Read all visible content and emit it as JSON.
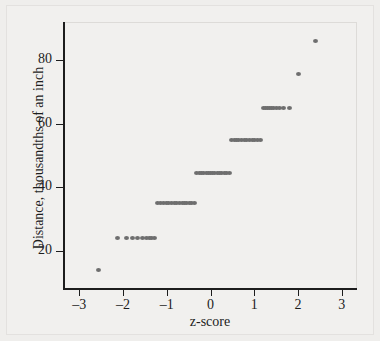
{
  "figure": {
    "background_color": "#efeeec",
    "point_color": "#6e6e6e",
    "axis_color": "#1d1d1d"
  },
  "axes": {
    "xlabel": "z-score",
    "ylabel": "Distance, thousandths of an inch",
    "xticks": [
      "–3",
      "–2",
      "–1",
      "0",
      "1",
      "2",
      "3"
    ],
    "xtick_values": [
      -3,
      -2,
      -1,
      0,
      1,
      2,
      3
    ],
    "yticks": [
      "20",
      "40",
      "60",
      "80"
    ],
    "ytick_values": [
      20,
      40,
      60,
      80
    ]
  },
  "chart_data": {
    "type": "scatter",
    "title": "",
    "xlabel": "z-score",
    "ylabel": "Distance, thousandths of an inch",
    "xlim": [
      -3.35,
      3.35
    ],
    "ylim": [
      8,
      92
    ],
    "grid": false,
    "legend": null,
    "x": [
      -2.55,
      -2.12,
      -1.92,
      -1.79,
      -1.66,
      -1.56,
      -1.47,
      -1.4,
      -1.34,
      -1.29,
      -1.22,
      -1.15,
      -1.08,
      -1.01,
      -0.95,
      -0.89,
      -0.83,
      -0.77,
      -0.71,
      -0.65,
      -0.6,
      -0.54,
      -0.48,
      -0.43,
      -0.37,
      -0.32,
      -0.26,
      -0.21,
      -0.15,
      -0.1,
      -0.05,
      0.0,
      0.05,
      0.1,
      0.15,
      0.21,
      0.26,
      0.32,
      0.37,
      0.43,
      0.48,
      0.54,
      0.6,
      0.65,
      0.71,
      0.77,
      0.83,
      0.89,
      0.95,
      1.01,
      1.08,
      1.15,
      1.22,
      1.26,
      1.3,
      1.34,
      1.39,
      1.44,
      1.5,
      1.58,
      1.67,
      1.8,
      2.02,
      2.41
    ],
    "y": [
      14,
      24,
      24,
      24,
      24,
      24,
      24,
      24,
      24,
      24,
      35,
      35,
      35,
      35,
      35,
      35,
      35,
      35,
      35,
      35,
      35,
      35,
      35,
      35,
      35,
      44.5,
      44.5,
      44.5,
      44.5,
      44.5,
      44.5,
      44.5,
      44.5,
      44.5,
      44.5,
      44.5,
      44.5,
      44.5,
      44.5,
      44.5,
      55,
      55,
      55,
      55,
      55,
      55,
      55,
      55,
      55,
      55,
      55,
      55,
      65,
      65,
      65,
      65,
      65,
      65,
      65,
      65,
      65,
      65,
      75.5,
      86
    ],
    "levels": [
      {
        "value": 14,
        "count": 1,
        "z_range": [
          -2.55,
          -2.55
        ]
      },
      {
        "value": 24,
        "count": 9,
        "z_range": [
          -2.12,
          -1.29
        ]
      },
      {
        "value": 35,
        "count": 15,
        "z_range": [
          -1.22,
          -0.37
        ]
      },
      {
        "value": 44.5,
        "count": 15,
        "z_range": [
          -0.32,
          0.43
        ]
      },
      {
        "value": 55,
        "count": 12,
        "z_range": [
          0.48,
          1.15
        ]
      },
      {
        "value": 65,
        "count": 10,
        "z_range": [
          1.22,
          1.8
        ]
      },
      {
        "value": 75.5,
        "count": 1,
        "z_range": [
          2.02,
          2.02
        ]
      },
      {
        "value": 86,
        "count": 1,
        "z_range": [
          2.41,
          2.41
        ]
      }
    ]
  }
}
